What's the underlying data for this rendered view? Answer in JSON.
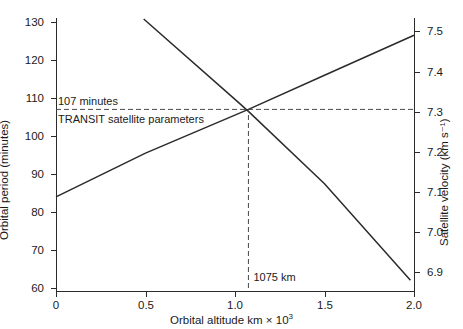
{
  "chart_data": {
    "type": "line",
    "title": "",
    "xlabel": "Orbital altitude  km × 10³",
    "ylabel": "Orbital period (minutes)",
    "ylabel_right": "Satellite velocity (km s⁻¹)",
    "xlim": [
      0,
      2.0
    ],
    "ylim": [
      60,
      133
    ],
    "ylim_right": [
      6.845,
      7.53
    ],
    "xticks": [
      0,
      0.5,
      1.0,
      1.5,
      2.0
    ],
    "xticklabels": [
      "0",
      "0.5",
      "1.0",
      "1.5",
      "2.0"
    ],
    "yticks": [
      60,
      70,
      80,
      90,
      100,
      110,
      120,
      130
    ],
    "yticklabels": [
      "60",
      "70",
      "80",
      "90",
      "100",
      "110",
      "120",
      "130"
    ],
    "yticks_right": [
      6.9,
      7.0,
      7.1,
      7.2,
      7.3,
      7.4,
      7.5
    ],
    "yticklabels_right": [
      "6.9",
      "7.0",
      "7.1",
      "7.2",
      "7.3",
      "7.4",
      "7.5"
    ],
    "grid": false,
    "legend": "none",
    "series": [
      {
        "name": "Orbital period",
        "axis": "left",
        "style": "solid",
        "color": "#2b2b2b",
        "x": [
          0.0,
          0.5,
          1.075,
          1.5,
          2.0
        ],
        "y": [
          84.0,
          95.5,
          107.0,
          116.0,
          126.5
        ]
      },
      {
        "name": "Satellite velocity",
        "axis": "right",
        "style": "solid",
        "color": "#2b2b2b",
        "x": [
          0.49,
          1.0,
          1.075,
          1.5,
          1.98
        ],
        "y": [
          7.53,
          7.33,
          7.3,
          7.12,
          6.88
        ]
      }
    ],
    "annotations": [
      {
        "name": "period-107-guide",
        "text": "107 minutes",
        "style": "dashed-horizontal",
        "y_left": 107.0,
        "y_right": 7.3,
        "x_from": 0.0,
        "x_to": 2.0
      },
      {
        "name": "transit-label",
        "text": "TRANSIT satellite parameters",
        "style": "text"
      },
      {
        "name": "altitude-1075-guide",
        "text": "1075 km",
        "style": "dashed-vertical",
        "x": 1.075,
        "y_from": 60,
        "y_to": 107.0
      }
    ],
    "intersection": {
      "x": 1.075,
      "period": 107.0,
      "velocity": 7.3
    }
  },
  "axes": {
    "left": {
      "label": "Orbital period (minutes)",
      "ticks": [
        {
          "value": 130,
          "label": "130",
          "px": 22
        },
        {
          "value": 120,
          "label": "120",
          "px": 60
        },
        {
          "value": 110,
          "label": "110",
          "px": 98
        },
        {
          "value": 100,
          "label": "100",
          "px": 136
        },
        {
          "value": 90,
          "label": "90",
          "px": 174
        },
        {
          "value": 80,
          "label": "80",
          "px": 212
        },
        {
          "value": 70,
          "label": "70",
          "px": 250
        },
        {
          "value": 60,
          "label": "60",
          "px": 288
        }
      ]
    },
    "right": {
      "label": "Satellite velocity (km s⁻¹)",
      "ticks": [
        {
          "value": 7.5,
          "label": "7.5",
          "px": 31
        },
        {
          "value": 7.4,
          "label": "7.4",
          "px": 72
        },
        {
          "value": 7.3,
          "label": "7.3",
          "px": 112
        },
        {
          "value": 7.2,
          "label": "7.2",
          "px": 152
        },
        {
          "value": 7.1,
          "label": "7.1",
          "px": 192
        },
        {
          "value": 7.0,
          "label": "7.0",
          "px": 232
        },
        {
          "value": 6.9,
          "label": "6.9",
          "px": 272
        }
      ]
    },
    "bottom": {
      "label_pre": "Orbital altitude  km × 10",
      "label_sup": "3",
      "ticks": [
        {
          "value": 0,
          "label": "0",
          "px": 56
        },
        {
          "value": 0.5,
          "label": "0.5",
          "px": 146
        },
        {
          "value": 1.0,
          "label": "1.0",
          "px": 235
        },
        {
          "value": 1.5,
          "label": "1.5",
          "px": 325
        },
        {
          "value": 2.0,
          "label": "2.0",
          "px": 414
        }
      ]
    }
  },
  "annotations": {
    "period_value": "107 minutes",
    "transit": "TRANSIT satellite parameters",
    "altitude_value": "1075 km"
  },
  "colors": {
    "line": "#2b2b2b",
    "axis": "#2b2b2b",
    "dashed": "#4a4a4a",
    "background": "#ffffff"
  }
}
